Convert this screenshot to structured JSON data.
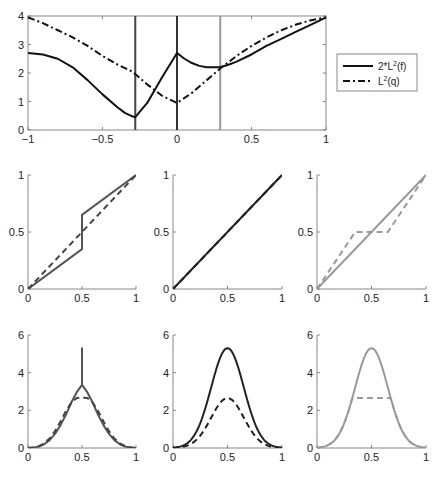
{
  "colors": {
    "black": "#111111",
    "dark_gray": "#444444",
    "mid_gray": "#555555",
    "light_gray": "#999999",
    "axis": "#888888"
  },
  "chart_data": [
    {
      "id": "top",
      "type": "line",
      "title": "",
      "xlabel": "",
      "ylabel": "",
      "xlim": [
        -1,
        1
      ],
      "ylim": [
        0,
        4
      ],
      "xticks": [
        "-1",
        "-0.5",
        "0",
        "0.5",
        "1"
      ],
      "xtick_values": [
        -1,
        -0.5,
        0,
        0.5,
        1
      ],
      "yticks": [
        "0",
        "1",
        "2",
        "3",
        "4"
      ],
      "ytick_values": [
        0,
        1,
        2,
        3,
        4
      ],
      "grid": false,
      "box": true,
      "legend": {
        "position": "outside-right",
        "entries": [
          {
            "label": "2*L",
            "sup": "2",
            "suffix": "(f)",
            "style": "solid",
            "color": "#111111"
          },
          {
            "label": "L",
            "sup": "2",
            "suffix": "(q)",
            "style": "dashdot",
            "color": "#111111"
          }
        ]
      },
      "series": [
        {
          "name": "2*L^2(f)",
          "style": "solid",
          "color": "#111111",
          "x": [
            -1,
            -0.9,
            -0.8,
            -0.7,
            -0.6,
            -0.5,
            -0.4,
            -0.35,
            -0.3,
            -0.28,
            -0.2,
            -0.1,
            0,
            0.05,
            0.1,
            0.15,
            0.2,
            0.25,
            0.29,
            0.35,
            0.4,
            0.5,
            0.6,
            0.7,
            0.8,
            0.9,
            1
          ],
          "y": [
            2.7,
            2.65,
            2.5,
            2.2,
            1.75,
            1.25,
            0.8,
            0.6,
            0.48,
            0.45,
            0.95,
            1.85,
            2.7,
            2.5,
            2.35,
            2.25,
            2.2,
            2.2,
            2.2,
            2.3,
            2.4,
            2.65,
            2.95,
            3.2,
            3.45,
            3.7,
            3.95
          ]
        },
        {
          "name": "L^2(q)",
          "style": "dashdot",
          "color": "#111111",
          "x": [
            -1,
            -0.9,
            -0.8,
            -0.7,
            -0.6,
            -0.5,
            -0.4,
            -0.3,
            -0.2,
            -0.1,
            0,
            0.1,
            0.2,
            0.3,
            0.4,
            0.5,
            0.6,
            0.7,
            0.8,
            0.9,
            1
          ],
          "y": [
            3.95,
            3.75,
            3.5,
            3.25,
            2.95,
            2.6,
            2.3,
            2.05,
            1.6,
            1.2,
            0.95,
            1.3,
            1.75,
            2.2,
            2.6,
            2.95,
            3.25,
            3.5,
            3.7,
            3.85,
            3.95
          ]
        }
      ],
      "vlines": [
        {
          "x": -0.28,
          "color": "#444444"
        },
        {
          "x": 0,
          "color": "#333333"
        },
        {
          "x": 0.29,
          "color": "#999999"
        }
      ]
    },
    {
      "id": "mid-left",
      "type": "line",
      "xlim": [
        0,
        1
      ],
      "ylim": [
        0,
        1
      ],
      "xticks": [
        "0",
        "0.5",
        "1"
      ],
      "xtick_values": [
        0,
        0.5,
        1
      ],
      "yticks": [
        "0",
        "0.5",
        "1"
      ],
      "ytick_values": [
        0,
        0.5,
        1
      ],
      "box": false,
      "series": [
        {
          "name": "solid",
          "style": "solid",
          "color": "#555555",
          "x": [
            0,
            0.5,
            0.5,
            1
          ],
          "y": [
            0,
            0.35,
            0.65,
            1
          ]
        },
        {
          "name": "dashed",
          "style": "dashed",
          "color": "#444444",
          "x": [
            0,
            1
          ],
          "y": [
            0,
            1
          ]
        }
      ]
    },
    {
      "id": "mid-center",
      "type": "line",
      "xlim": [
        0,
        1
      ],
      "ylim": [
        0,
        1
      ],
      "xticks": [
        "0",
        "0.5",
        "1"
      ],
      "xtick_values": [
        0,
        0.5,
        1
      ],
      "yticks": [
        "0",
        "0.5",
        "1"
      ],
      "ytick_values": [
        0,
        0.5,
        1
      ],
      "box": false,
      "series": [
        {
          "name": "solid",
          "style": "solid",
          "color": "#222222",
          "x": [
            0,
            1
          ],
          "y": [
            0,
            1
          ]
        },
        {
          "name": "dashed",
          "style": "dashed",
          "color": "#222222",
          "x": [
            0,
            1
          ],
          "y": [
            0,
            1
          ]
        }
      ]
    },
    {
      "id": "mid-right",
      "type": "line",
      "xlim": [
        0,
        1
      ],
      "ylim": [
        0,
        1
      ],
      "xticks": [
        "0",
        "0.5",
        "1"
      ],
      "xtick_values": [
        0,
        0.5,
        1
      ],
      "yticks": [
        "0",
        "0.5",
        "1"
      ],
      "ytick_values": [
        0,
        0.5,
        1
      ],
      "box": false,
      "series": [
        {
          "name": "solid",
          "style": "solid",
          "color": "#999999",
          "x": [
            0,
            1
          ],
          "y": [
            0,
            1
          ]
        },
        {
          "name": "dashed",
          "style": "dashed",
          "color": "#999999",
          "x": [
            0,
            0.35,
            0.65,
            1
          ],
          "y": [
            0,
            0.5,
            0.5,
            1
          ]
        }
      ]
    },
    {
      "id": "bottom-left",
      "type": "line",
      "xlim": [
        0,
        1
      ],
      "ylim": [
        0,
        6
      ],
      "xticks": [
        "0",
        "0.5",
        "1"
      ],
      "xtick_values": [
        0,
        0.5,
        1
      ],
      "yticks": [
        "0",
        "2",
        "4",
        "6"
      ],
      "ytick_values": [
        0,
        2,
        4,
        6
      ],
      "box": false,
      "series": [
        {
          "name": "solid",
          "style": "solid",
          "color": "#555555",
          "x": [
            0,
            0.05,
            0.1,
            0.15,
            0.2,
            0.25,
            0.3,
            0.35,
            0.4,
            0.45,
            0.5,
            0.5,
            0.5,
            0.55,
            0.6,
            0.65,
            0.7,
            0.75,
            0.8,
            0.85,
            0.9,
            0.95,
            1
          ],
          "y": [
            0,
            0.02,
            0.08,
            0.2,
            0.42,
            0.75,
            1.2,
            1.75,
            2.4,
            2.95,
            3.35,
            5.3,
            3.35,
            2.95,
            2.4,
            1.75,
            1.2,
            0.75,
            0.42,
            0.2,
            0.08,
            0.02,
            0
          ]
        },
        {
          "name": "dashed",
          "style": "dashed",
          "color": "#444444",
          "x": [
            0,
            0.05,
            0.1,
            0.15,
            0.2,
            0.25,
            0.3,
            0.35,
            0.4,
            0.45,
            0.5,
            0.55,
            0.6,
            0.65,
            0.7,
            0.75,
            0.8,
            0.85,
            0.9,
            0.95,
            1
          ],
          "y": [
            0,
            0.03,
            0.1,
            0.25,
            0.5,
            0.9,
            1.4,
            1.95,
            2.4,
            2.65,
            2.68,
            2.65,
            2.4,
            1.95,
            1.4,
            0.9,
            0.5,
            0.25,
            0.1,
            0.03,
            0
          ]
        }
      ]
    },
    {
      "id": "bottom-center",
      "type": "line",
      "xlim": [
        0,
        1
      ],
      "ylim": [
        0,
        6
      ],
      "xticks": [
        "0",
        "0.5",
        "1"
      ],
      "xtick_values": [
        0,
        0.5,
        1
      ],
      "yticks": [
        "0",
        "2",
        "4",
        "6"
      ],
      "ytick_values": [
        0,
        2,
        4,
        6
      ],
      "box": false,
      "series": [
        {
          "name": "solid",
          "style": "solid",
          "color": "#222222",
          "gaussian": {
            "mu": 0.5,
            "sigma": 0.15,
            "peak": 5.3
          }
        },
        {
          "name": "dashed",
          "style": "dashed",
          "color": "#222222",
          "gaussian": {
            "mu": 0.5,
            "sigma": 0.15,
            "peak": 2.65
          }
        }
      ]
    },
    {
      "id": "bottom-right",
      "type": "line",
      "xlim": [
        0,
        1
      ],
      "ylim": [
        0,
        6
      ],
      "xticks": [
        "0",
        "0.5",
        "1"
      ],
      "xtick_values": [
        0,
        0.5,
        1
      ],
      "yticks": [
        "0",
        "2",
        "4",
        "6"
      ],
      "ytick_values": [
        0,
        2,
        4,
        6
      ],
      "box": false,
      "series": [
        {
          "name": "solid",
          "style": "solid",
          "color": "#999999",
          "gaussian": {
            "mu": 0.5,
            "sigma": 0.15,
            "peak": 5.3
          }
        },
        {
          "name": "dashed",
          "style": "dashed",
          "color": "#999999",
          "gaussian": {
            "mu": 0.5,
            "sigma": 0.15,
            "peak": 5.3,
            "clip": 2.65
          }
        }
      ]
    }
  ]
}
